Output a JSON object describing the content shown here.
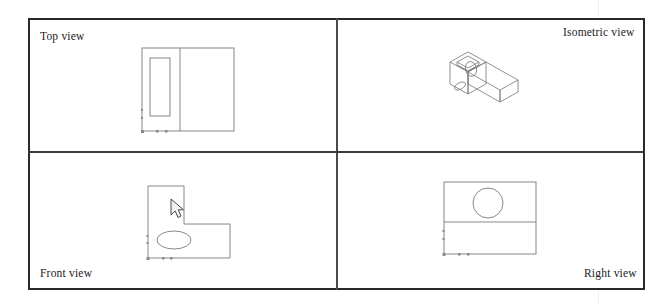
{
  "document": {
    "title": "Orthographic projection worksheet",
    "background_color": "#ffffff",
    "line_color": "#6b6b6b",
    "frame_color": "#2a2a2a"
  },
  "frame": {
    "columns": 2,
    "rows": 2
  },
  "views": {
    "top": {
      "label": "Top view",
      "label_position": "top-left",
      "description": "Rectangle divided by a vertical line with an inner slot rectangle on the left side",
      "shapes": [
        {
          "type": "rect",
          "name": "outer-boundary"
        },
        {
          "type": "line",
          "name": "vertical-division-line"
        },
        {
          "type": "rect",
          "name": "inner-slot-rect"
        }
      ],
      "origin_markers": 3
    },
    "isometric": {
      "label": "Isometric view",
      "label_position": "top-right",
      "description": "L-shaped block in isometric projection with a rectangular slot on the upper face and a circular hole through the vertical wall",
      "shapes": [
        {
          "type": "polyline",
          "name": "block-body"
        },
        {
          "type": "polyline",
          "name": "top-slot"
        },
        {
          "type": "ellipse",
          "name": "circular-hole"
        }
      ]
    },
    "front": {
      "label": "Front view",
      "label_position": "bottom-left",
      "description": "L-shaped outline with an ellipse (hole) in the lower left region",
      "shapes": [
        {
          "type": "polygon",
          "name": "l-shape-outline"
        },
        {
          "type": "ellipse",
          "name": "hole-ellipse"
        }
      ],
      "origin_markers": 3
    },
    "right": {
      "label": "Right view",
      "label_position": "bottom-right",
      "description": "Rectangle divided by a horizontal line with a circle in the upper half",
      "shapes": [
        {
          "type": "rect",
          "name": "outer-boundary"
        },
        {
          "type": "line",
          "name": "horizontal-division-line"
        },
        {
          "type": "circle",
          "name": "hole-circle"
        }
      ],
      "origin_markers": 3
    }
  },
  "cursor": {
    "name": "mouse-pointer",
    "visible": true,
    "location_view": "front"
  }
}
